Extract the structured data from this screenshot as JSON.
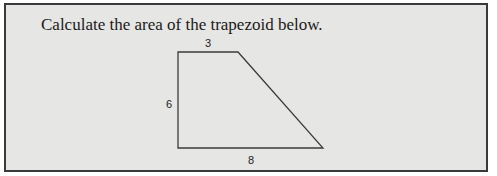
{
  "question": {
    "prompt": "Calculate the area of the trapezoid below."
  },
  "figure": {
    "shape": "trapezoid",
    "labels": {
      "top": "3",
      "left": "6",
      "bottom": "8"
    }
  }
}
